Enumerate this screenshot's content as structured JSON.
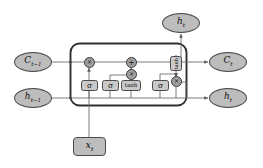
{
  "diagram": {
    "colors": {
      "node_fill": "#bdbdbd",
      "gate_fill": "#c9c9c9",
      "operator_fill": "#9f9f9f",
      "stroke": "#4a4a4a",
      "background": "#ffffff",
      "wire": "#6e6e6e"
    },
    "inputs": [
      {
        "id": "cell-state-prev",
        "label": "C",
        "subscript": "t−1",
        "shape": "ellipse",
        "side": "left"
      },
      {
        "id": "hidden-state-prev",
        "label": "h",
        "subscript": "t−1",
        "shape": "ellipse",
        "side": "left"
      },
      {
        "id": "input-x",
        "label": "x",
        "subscript": "t",
        "shape": "rounded-rect",
        "side": "bottom"
      }
    ],
    "outputs": [
      {
        "id": "cell-state-next",
        "label": "C",
        "subscript": "t",
        "shape": "ellipse",
        "side": "right"
      },
      {
        "id": "hidden-state-next",
        "label": "h",
        "subscript": "t",
        "shape": "ellipse",
        "side": "right"
      },
      {
        "id": "hidden-state-out-top",
        "label": "h",
        "subscript": "t",
        "shape": "ellipse",
        "side": "top"
      }
    ],
    "gates": [
      {
        "id": "forget-gate",
        "label": "σ",
        "name": "sigma-forget"
      },
      {
        "id": "input-gate",
        "label": "σ",
        "name": "sigma-input"
      },
      {
        "id": "candidate-gate",
        "label": "tanh",
        "name": "tanh-candidate"
      },
      {
        "id": "output-gate",
        "label": "σ",
        "name": "sigma-output"
      },
      {
        "id": "cell-tanh",
        "label": "tanh",
        "name": "tanh-cell-state",
        "orientation": "vertical"
      }
    ],
    "operators": [
      {
        "id": "mul-forget",
        "label": "×",
        "op": "multiply"
      },
      {
        "id": "add-cell",
        "label": "+",
        "op": "add"
      },
      {
        "id": "mul-input",
        "label": "×",
        "op": "multiply"
      },
      {
        "id": "mul-output",
        "label": "×",
        "op": "multiply"
      }
    ]
  }
}
